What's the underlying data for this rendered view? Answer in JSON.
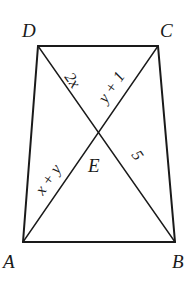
{
  "figure": {
    "type": "trapezoid with diagonals",
    "vertices": {
      "A": {
        "label": "A",
        "x": 23,
        "y": 242
      },
      "B": {
        "label": "B",
        "x": 175,
        "y": 242
      },
      "C": {
        "label": "C",
        "x": 158,
        "y": 46
      },
      "D": {
        "label": "D",
        "x": 38,
        "y": 46
      },
      "E": {
        "label": "E",
        "x": 99,
        "y": 133
      }
    },
    "segment_labels": {
      "DE": "2x",
      "CE": "y + 1",
      "AE": "x + y",
      "BE": "5"
    },
    "stroke_color": "#1a1a1a"
  }
}
